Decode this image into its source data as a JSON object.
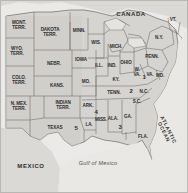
{
  "map": {
    "title": "Historical map of the United States with territories",
    "frame_color": "#b9b7b3",
    "land_color": "#d8d6d2",
    "territory_color": "#c9c7c3",
    "water_color": "#eceae7",
    "border_color": "#6e6c68",
    "countries": [
      {
        "name": "canada-label",
        "label": "CANADA",
        "x": 131,
        "y": 14
      },
      {
        "name": "mexico-label",
        "label": "MEXICO",
        "x": 31,
        "y": 166
      }
    ],
    "oceans": [
      {
        "name": "atlantic-ocean-label",
        "label": "ATLANTIC\nOCEAN",
        "x": 166,
        "y": 131
      },
      {
        "name": "gulf-of-mexico-label",
        "label": "Gulf of Mexico",
        "x": 98,
        "y": 164
      }
    ],
    "territories": [
      {
        "name": "montana-territory",
        "label": "MONT.\nTERR.",
        "x": 19,
        "y": 26
      },
      {
        "name": "dakota-territory",
        "label": "DAKOTA\nTERR.",
        "x": 50,
        "y": 33
      },
      {
        "name": "wyoming-territory",
        "label": "WYO.\nTERR.",
        "x": 17,
        "y": 52
      },
      {
        "name": "colorado-territory",
        "label": "COLO.\nTERR.",
        "x": 19,
        "y": 81
      },
      {
        "name": "new-mexico-territory",
        "label": "N. MEX.\nTERR.",
        "x": 19,
        "y": 107
      },
      {
        "name": "indian-territory",
        "label": "INDIAN\nTERR.",
        "x": 63,
        "y": 106
      }
    ],
    "states": [
      {
        "name": "minnesota",
        "label": "MINN.",
        "x": 79,
        "y": 31
      },
      {
        "name": "wisconsin",
        "label": "WIS.",
        "x": 96,
        "y": 43
      },
      {
        "name": "michigan",
        "label": "MICH.",
        "x": 116,
        "y": 47
      },
      {
        "name": "iowa",
        "label": "IOWA",
        "x": 81,
        "y": 60
      },
      {
        "name": "nebraska",
        "label": "NEBR.",
        "x": 54,
        "y": 64
      },
      {
        "name": "kansas",
        "label": "KANS.",
        "x": 57,
        "y": 86
      },
      {
        "name": "missouri",
        "label": "MO.",
        "x": 86,
        "y": 82
      },
      {
        "name": "illinois",
        "label": "ILL.",
        "x": 99,
        "y": 66
      },
      {
        "name": "indiana",
        "label": "IND.",
        "x": 112,
        "y": 66
      },
      {
        "name": "ohio",
        "label": "OHIO",
        "x": 126,
        "y": 63
      },
      {
        "name": "kentucky",
        "label": "KY.",
        "x": 116,
        "y": 80
      },
      {
        "name": "tennessee",
        "label": "TENN.",
        "x": 114,
        "y": 93
      },
      {
        "name": "arkansas",
        "label": "ARK.",
        "x": 88,
        "y": 106
      },
      {
        "name": "louisiana",
        "label": "LA.",
        "x": 89,
        "y": 125
      },
      {
        "name": "mississippi",
        "label": "MISS.",
        "x": 101,
        "y": 120
      },
      {
        "name": "alabama",
        "label": "ALA.",
        "x": 113,
        "y": 119
      },
      {
        "name": "georgia",
        "label": "GA.",
        "x": 128,
        "y": 117
      },
      {
        "name": "florida",
        "label": "FLA.",
        "x": 143,
        "y": 137
      },
      {
        "name": "texas",
        "label": "TEXAS",
        "x": 55,
        "y": 128
      },
      {
        "name": "south-carolina",
        "label": "S.C.",
        "x": 137,
        "y": 102
      },
      {
        "name": "north-carolina",
        "label": "N.C.",
        "x": 144,
        "y": 92
      },
      {
        "name": "virginia",
        "label": "VA.",
        "x": 150,
        "y": 75
      },
      {
        "name": "west-virginia",
        "label": "W.\nVA.",
        "x": 137,
        "y": 73
      },
      {
        "name": "maryland",
        "label": "MD.",
        "x": 160,
        "y": 76
      },
      {
        "name": "pennsylvania",
        "label": "PENN.",
        "x": 152,
        "y": 57
      },
      {
        "name": "new-york",
        "label": "N.Y.",
        "x": 159,
        "y": 38
      },
      {
        "name": "vermont",
        "label": "VT.",
        "x": 173,
        "y": 20
      }
    ],
    "numbers": [
      {
        "name": "number-marker-1",
        "label": "1",
        "x": 144,
        "y": 77
      },
      {
        "name": "number-marker-2",
        "label": "2",
        "x": 131,
        "y": 91
      },
      {
        "name": "number-marker-3",
        "label": "3",
        "x": 120,
        "y": 127
      },
      {
        "name": "number-marker-4",
        "label": "4",
        "x": 96,
        "y": 112
      },
      {
        "name": "number-marker-5",
        "label": "5",
        "x": 76,
        "y": 128
      }
    ]
  }
}
